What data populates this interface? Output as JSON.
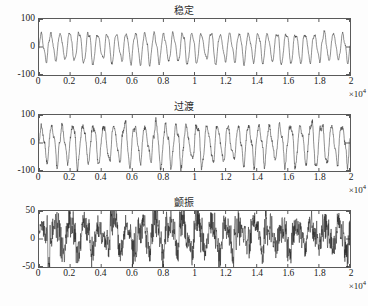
{
  "figure": {
    "background": "#fdfdfd",
    "axis_color": "#5a5a5a",
    "trace_color": "#333333"
  },
  "chart_data": [
    {
      "type": "line",
      "title": "稳定",
      "xlabel": "",
      "ylabel": "",
      "xlim": [
        0,
        20000
      ],
      "ylim": [
        -100,
        100
      ],
      "x_exponent": "×10",
      "x_exponent_power": "4",
      "xticks": [
        0,
        0.2,
        0.4,
        0.6,
        0.8,
        1,
        1.2,
        1.4,
        1.6,
        1.8,
        2
      ],
      "xticklabels": [
        "0",
        "0.2",
        "0.4",
        "0.6",
        "0.8",
        "1",
        "1.2",
        "1.4",
        "1.6",
        "1.8",
        "2"
      ],
      "yticks": [
        -100,
        0,
        100
      ],
      "yticklabels": [
        "-100",
        "0",
        "100"
      ],
      "grid": false,
      "legend": null,
      "description": "Steady periodic vibration, roughly sinusoidal, amplitude about ±50 units, approximately 33 cycles across 0 to 2e4 samples.",
      "signal": {
        "n_cycles": 33,
        "amplitude": 50,
        "amplitude_modulation": 0.16,
        "mean": 0,
        "noise": 0.04,
        "harmonic2": 0.18,
        "seed": 11
      }
    },
    {
      "type": "line",
      "title": "过渡",
      "xlabel": "",
      "ylabel": "",
      "xlim": [
        0,
        20000
      ],
      "ylim": [
        -100,
        100
      ],
      "x_exponent": "×10",
      "x_exponent_power": "4",
      "xticks": [
        0,
        0.2,
        0.4,
        0.6,
        0.8,
        1,
        1.2,
        1.4,
        1.6,
        1.8,
        2
      ],
      "xticklabels": [
        "0",
        "0.2",
        "0.4",
        "0.6",
        "0.8",
        "1",
        "1.2",
        "1.4",
        "1.6",
        "1.8",
        "2"
      ],
      "yticks": [
        -100,
        0,
        100
      ],
      "yticklabels": [
        "-100",
        "0",
        "100"
      ],
      "grid": false,
      "legend": null,
      "description": "Transition-state vibration, periodic with larger and more irregular amplitude, peaks about ±65 to ±80 units, roughly 30 cycles across 0 to 2e4.",
      "signal": {
        "n_cycles": 30,
        "amplitude": 65,
        "amplitude_modulation": 0.22,
        "mean": 0,
        "noise": 0.07,
        "harmonic2": 0.22,
        "seed": 29
      }
    },
    {
      "type": "line",
      "title": "颤振",
      "xlabel": "",
      "ylabel": "",
      "xlim": [
        0,
        20000
      ],
      "ylim": [
        -50,
        50
      ],
      "x_exponent": "×10",
      "x_exponent_power": "4",
      "xticks": [
        0,
        0.2,
        0.4,
        0.6,
        0.8,
        1,
        1.2,
        1.4,
        1.6,
        1.8,
        2
      ],
      "xticklabels": [
        "0",
        "0.2",
        "0.4",
        "0.6",
        "0.8",
        "1",
        "1.2",
        "1.4",
        "1.6",
        "1.8",
        "2"
      ],
      "yticks": [
        -50,
        0,
        50
      ],
      "yticklabels": [
        "-50",
        "0",
        "50"
      ],
      "grid": false,
      "legend": null,
      "description": "Chatter/flutter signal: broadband noisy trace, biased positive, peaks near +45 and troughs near -25, heavy high-frequency content.",
      "signal": {
        "n_cycles": 22,
        "amplitude": 22,
        "amplitude_modulation": 0.45,
        "mean": 8,
        "noise": 0.62,
        "harmonic2": 0.35,
        "seed": 73
      }
    }
  ]
}
